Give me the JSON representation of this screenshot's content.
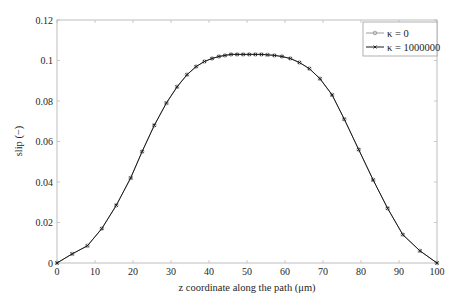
{
  "chart_data": {
    "type": "line",
    "title": "",
    "xlabel": "z coordinate along the path (μm)",
    "ylabel": "slip (−)",
    "xlim": [
      0,
      100
    ],
    "ylim": [
      0,
      0.12
    ],
    "xticks": [
      0,
      10,
      20,
      30,
      40,
      50,
      60,
      70,
      80,
      90,
      100
    ],
    "xtick_labels": [
      "0",
      "10",
      "20",
      "30",
      "40",
      "50",
      "60",
      "70",
      "80",
      "90",
      "100"
    ],
    "yticks": [
      0,
      0.02,
      0.04,
      0.06,
      0.08,
      0.1,
      0.12
    ],
    "ytick_labels": [
      "0",
      "0.02",
      "0.04",
      "0.06",
      "0.08",
      "0.1",
      "0.12"
    ],
    "grid": false,
    "legend_position": "upper right",
    "x": [
      0,
      4,
      8,
      11.8,
      15.6,
      19.4,
      22.4,
      25.6,
      28.8,
      31.6,
      34.2,
      36.6,
      38.8,
      40.8,
      42.6,
      44.2,
      45.8,
      47.4,
      49,
      50.6,
      52.2,
      53.8,
      55.4,
      57.2,
      59.2,
      61.4,
      63.8,
      66.4,
      69.2,
      72.4,
      75.6,
      79.4,
      83.2,
      87,
      91,
      95.5,
      100
    ],
    "series": [
      {
        "name": "κ = 0",
        "color": "#9a9a9a",
        "marker": "circle",
        "values": [
          0,
          0.0045,
          0.0085,
          0.017,
          0.0285,
          0.042,
          0.055,
          0.068,
          0.079,
          0.087,
          0.093,
          0.097,
          0.0995,
          0.101,
          0.102,
          0.1025,
          0.103,
          0.103,
          0.103,
          0.103,
          0.103,
          0.103,
          0.1028,
          0.1025,
          0.102,
          0.101,
          0.099,
          0.096,
          0.091,
          0.083,
          0.071,
          0.056,
          0.041,
          0.027,
          0.014,
          0.006,
          0
        ]
      },
      {
        "name": "κ = 1000000",
        "color": "#1a1a1a",
        "marker": "x",
        "values": [
          0,
          0.0045,
          0.0085,
          0.017,
          0.0285,
          0.042,
          0.055,
          0.068,
          0.079,
          0.087,
          0.093,
          0.097,
          0.0995,
          0.101,
          0.102,
          0.1025,
          0.103,
          0.103,
          0.103,
          0.103,
          0.103,
          0.103,
          0.1028,
          0.1025,
          0.102,
          0.101,
          0.099,
          0.096,
          0.091,
          0.083,
          0.071,
          0.056,
          0.041,
          0.027,
          0.014,
          0.006,
          0
        ]
      }
    ]
  },
  "legend": {
    "items": [
      "κ = 0",
      "κ = 1000000"
    ]
  }
}
